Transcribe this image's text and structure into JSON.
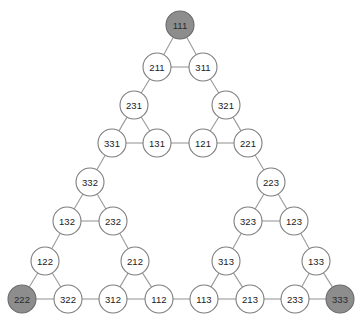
{
  "figure": {
    "background_color": "#ffffff",
    "node_fill": "#ffffff",
    "node_fill_shaded": "#8d8d8d",
    "node_stroke": "#7d7d7d",
    "edge_color": "#9a9a9a",
    "node_radius": 14,
    "label_color": "#1a1a1a"
  },
  "chart_data": {
    "type": "diagram",
    "xlabel": "",
    "ylabel": "",
    "grid": false,
    "legend": "none",
    "nodes": [
      {
        "id": "111",
        "label": "111",
        "x": 180,
        "y": 25,
        "shaded": true
      },
      {
        "id": "211",
        "label": "211",
        "x": 157,
        "y": 67,
        "shaded": false
      },
      {
        "id": "311",
        "label": "311",
        "x": 203,
        "y": 67,
        "shaded": false
      },
      {
        "id": "231",
        "label": "231",
        "x": 134,
        "y": 105,
        "shaded": false
      },
      {
        "id": "321",
        "label": "321",
        "x": 226,
        "y": 105,
        "shaded": false
      },
      {
        "id": "331",
        "label": "331",
        "x": 112,
        "y": 143,
        "shaded": false
      },
      {
        "id": "131",
        "label": "131",
        "x": 157,
        "y": 143,
        "shaded": false
      },
      {
        "id": "121",
        "label": "121",
        "x": 203,
        "y": 143,
        "shaded": false
      },
      {
        "id": "221",
        "label": "221",
        "x": 248,
        "y": 143,
        "shaded": false
      },
      {
        "id": "332",
        "label": "332",
        "x": 90,
        "y": 182,
        "shaded": false
      },
      {
        "id": "223",
        "label": "223",
        "x": 271,
        "y": 182,
        "shaded": false
      },
      {
        "id": "132",
        "label": "132",
        "x": 67,
        "y": 221,
        "shaded": false
      },
      {
        "id": "232",
        "label": "232",
        "x": 113,
        "y": 221,
        "shaded": false
      },
      {
        "id": "323",
        "label": "323",
        "x": 248,
        "y": 221,
        "shaded": false
      },
      {
        "id": "123",
        "label": "123",
        "x": 294,
        "y": 221,
        "shaded": false
      },
      {
        "id": "122",
        "label": "122",
        "x": 45,
        "y": 261,
        "shaded": false
      },
      {
        "id": "212",
        "label": "212",
        "x": 135,
        "y": 261,
        "shaded": false
      },
      {
        "id": "313",
        "label": "313",
        "x": 226,
        "y": 261,
        "shaded": false
      },
      {
        "id": "133",
        "label": "133",
        "x": 316,
        "y": 261,
        "shaded": false
      },
      {
        "id": "222",
        "label": "222",
        "x": 22,
        "y": 299,
        "shaded": true
      },
      {
        "id": "322",
        "label": "322",
        "x": 68,
        "y": 299,
        "shaded": false
      },
      {
        "id": "312",
        "label": "312",
        "x": 113,
        "y": 299,
        "shaded": false
      },
      {
        "id": "112",
        "label": "112",
        "x": 159,
        "y": 299,
        "shaded": false
      },
      {
        "id": "113",
        "label": "113",
        "x": 204,
        "y": 299,
        "shaded": false
      },
      {
        "id": "213",
        "label": "213",
        "x": 250,
        "y": 299,
        "shaded": false
      },
      {
        "id": "233",
        "label": "233",
        "x": 295,
        "y": 299,
        "shaded": false
      },
      {
        "id": "333",
        "label": "333",
        "x": 340,
        "y": 299,
        "shaded": true
      }
    ],
    "edges": [
      [
        "111",
        "211"
      ],
      [
        "111",
        "311"
      ],
      [
        "211",
        "311"
      ],
      [
        "211",
        "231"
      ],
      [
        "311",
        "321"
      ],
      [
        "231",
        "331"
      ],
      [
        "231",
        "131"
      ],
      [
        "331",
        "131"
      ],
      [
        "321",
        "121"
      ],
      [
        "321",
        "221"
      ],
      [
        "121",
        "221"
      ],
      [
        "131",
        "121"
      ],
      [
        "331",
        "332"
      ],
      [
        "221",
        "223"
      ],
      [
        "332",
        "132"
      ],
      [
        "332",
        "232"
      ],
      [
        "132",
        "232"
      ],
      [
        "223",
        "323"
      ],
      [
        "223",
        "123"
      ],
      [
        "323",
        "123"
      ],
      [
        "132",
        "122"
      ],
      [
        "232",
        "212"
      ],
      [
        "323",
        "313"
      ],
      [
        "123",
        "133"
      ],
      [
        "122",
        "222"
      ],
      [
        "122",
        "322"
      ],
      [
        "222",
        "322"
      ],
      [
        "212",
        "312"
      ],
      [
        "212",
        "112"
      ],
      [
        "312",
        "112"
      ],
      [
        "313",
        "113"
      ],
      [
        "313",
        "213"
      ],
      [
        "113",
        "213"
      ],
      [
        "133",
        "233"
      ],
      [
        "133",
        "333"
      ],
      [
        "233",
        "333"
      ],
      [
        "322",
        "312"
      ],
      [
        "112",
        "113"
      ],
      [
        "213",
        "233"
      ]
    ],
    "shaded_nodes": [
      "111",
      "222",
      "333"
    ],
    "node_count": 27,
    "edge_count": 39
  }
}
